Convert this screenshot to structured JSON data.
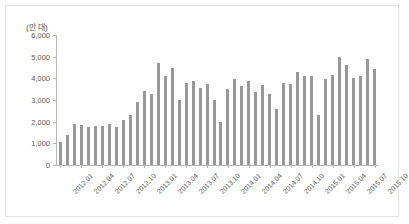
{
  "chart_data": {
    "type": "bar",
    "title": "",
    "subtitle": "",
    "unit_label": "(만 대)",
    "xlabel": "",
    "ylabel": "",
    "ylim": [
      0,
      6000
    ],
    "yticks": [
      0,
      1000,
      2000,
      3000,
      4000,
      5000,
      6000
    ],
    "ytick_labels": [
      "0",
      "1,000",
      "2,000",
      "3,000",
      "4,000",
      "5,000",
      "6,000"
    ],
    "grid": false,
    "legend": null,
    "bar_color": "#989898",
    "axis_color": "#b9b9b9",
    "text_color": "#58595b",
    "xtick_labels": [
      "2012.01",
      "2012.04",
      "2012.07",
      "2012.10",
      "2013.01",
      "2013.04",
      "2013.07",
      "2013.10",
      "2014.01",
      "2014.04",
      "2014.07",
      "2014.10",
      "2015.01",
      "2015.04",
      "2015.07",
      "2015.10"
    ],
    "xtick_indices": [
      0,
      3,
      6,
      9,
      12,
      15,
      18,
      21,
      24,
      27,
      30,
      33,
      36,
      39,
      42,
      45
    ],
    "categories": [
      "2012.01",
      "2012.02",
      "2012.03",
      "2012.04",
      "2012.05",
      "2012.06",
      "2012.07",
      "2012.08",
      "2012.09",
      "2012.10",
      "2012.11",
      "2012.12",
      "2013.01",
      "2013.02",
      "2013.03",
      "2013.04",
      "2013.05",
      "2013.06",
      "2013.07",
      "2013.08",
      "2013.09",
      "2013.10",
      "2013.11",
      "2013.12",
      "2014.01",
      "2014.02",
      "2014.03",
      "2014.04",
      "2014.05",
      "2014.06",
      "2014.07",
      "2014.08",
      "2014.09",
      "2014.10",
      "2014.11",
      "2014.12",
      "2015.01",
      "2015.02",
      "2015.03",
      "2015.04",
      "2015.05",
      "2015.06",
      "2015.07",
      "2015.08",
      "2015.09",
      "2015.10"
    ],
    "values": [
      1050,
      1400,
      1900,
      1850,
      1750,
      1800,
      1800,
      1900,
      1750,
      2100,
      2300,
      2900,
      3400,
      3300,
      4700,
      4100,
      4500,
      3000,
      3800,
      3900,
      3550,
      3750,
      3000,
      2000,
      3500,
      3950,
      3650,
      3900,
      3350,
      3700,
      3300,
      2600,
      3800,
      3750,
      4300,
      4100,
      4100,
      2300,
      3950,
      4150,
      5000,
      4600,
      4000,
      4100,
      4900,
      4450
    ]
  }
}
